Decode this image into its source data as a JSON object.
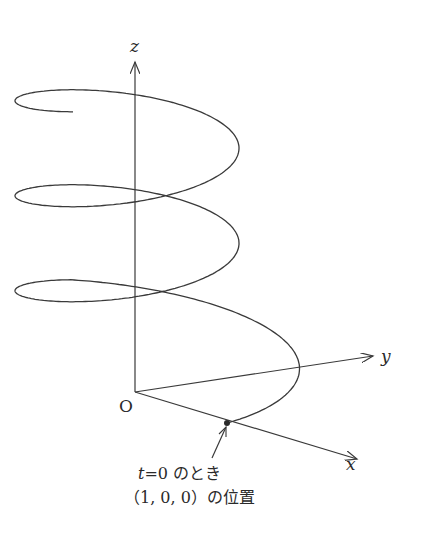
{
  "diagram": {
    "type": "3d-helix",
    "axes": {
      "z_label": "z",
      "y_label": "y",
      "x_label": "x",
      "origin_label": "O"
    },
    "helix": {
      "turns": 3,
      "start_point": [
        1,
        0,
        0
      ]
    },
    "annotation": {
      "line1_var": "t",
      "line1_rest": "=0 のとき",
      "line2": "（1, 0, 0）の位置"
    },
    "stroke_color": "#3a3a3a"
  }
}
